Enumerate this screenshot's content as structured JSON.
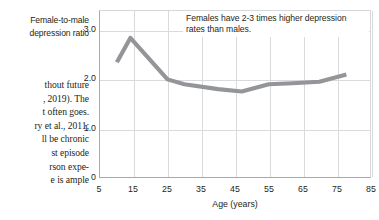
{
  "body_text": {
    "lines": [
      "thout future",
      ", 2019). The",
      "t often goes.",
      "ry et al., 2011;",
      "ll be chronic",
      "st episode",
      "rson expe-",
      "e is ample"
    ]
  },
  "chart_data": {
    "type": "line",
    "title": "",
    "xlabel": "Age (years)",
    "ylabel": "Female-to-male depression ratio",
    "ylabel_lines": [
      "Female-to-male",
      "depression ratio"
    ],
    "annotation": "Females have 2-3 times higher depression rates than males.",
    "xlim": [
      5,
      85
    ],
    "ylim": [
      0,
      3.4
    ],
    "xticks": [
      5,
      15,
      25,
      35,
      45,
      55,
      65,
      75,
      85
    ],
    "xtick_labels": [
      "5",
      "15",
      "25",
      "35",
      "45",
      "55",
      "65",
      "75",
      "85"
    ],
    "yticks": [
      0,
      1.0,
      2.0,
      3.0
    ],
    "ytick_labels": [
      "0",
      "1.0",
      "2.0",
      "3.0"
    ],
    "grid": true,
    "legend": "none",
    "line_color": "#939598",
    "x": [
      10,
      14,
      25,
      30,
      40,
      47,
      55,
      62,
      70,
      78
    ],
    "values": [
      2.35,
      2.85,
      2.0,
      1.9,
      1.8,
      1.75,
      1.9,
      1.92,
      1.95,
      2.1
    ],
    "series": [
      {
        "name": "Female-to-male depression ratio",
        "points": [
          {
            "age": 10,
            "ratio": 2.35
          },
          {
            "age": 14,
            "ratio": 2.85
          },
          {
            "age": 25,
            "ratio": 2.0
          },
          {
            "age": 30,
            "ratio": 1.9
          },
          {
            "age": 40,
            "ratio": 1.8
          },
          {
            "age": 47,
            "ratio": 1.75
          },
          {
            "age": 55,
            "ratio": 1.9
          },
          {
            "age": 62,
            "ratio": 1.92
          },
          {
            "age": 70,
            "ratio": 1.95
          },
          {
            "age": 78,
            "ratio": 2.1
          }
        ]
      }
    ]
  }
}
